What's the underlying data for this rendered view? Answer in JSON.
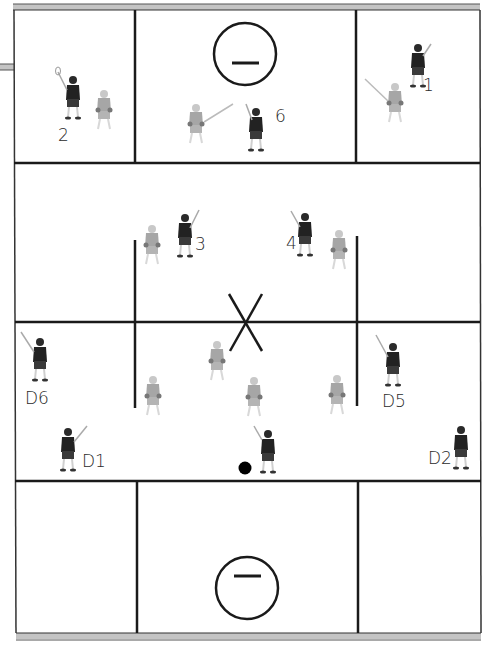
{
  "diagram": {
    "colors": {
      "line": "#1a1a1a",
      "boundary_shade": "#b8b8b8",
      "dark_team": "#222222",
      "light_team": "#9a9a9a",
      "ball": "#000000"
    },
    "labels": {
      "p2": "2",
      "p6": "6",
      "p1": "1",
      "p3": "3",
      "p4": "4",
      "d6": "D6",
      "d5": "D5",
      "d1": "D1",
      "d2": "D2"
    },
    "goals": [
      {
        "name": "top-goal",
        "symbol": "minus"
      },
      {
        "name": "bottom-goal",
        "symbol": "minus"
      }
    ],
    "center_mark": "X"
  }
}
